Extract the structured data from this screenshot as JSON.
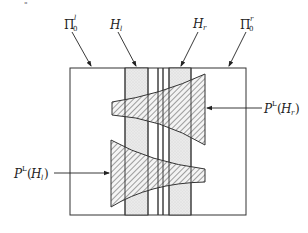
{
  "corner_mark": "\"",
  "labels": {
    "pi_left": {
      "base": "Π",
      "sub": "0",
      "sup": "l"
    },
    "h_left": {
      "base": "H",
      "sub": "l"
    },
    "h_right": {
      "base": "H",
      "sub": "r"
    },
    "pi_right": {
      "base": "Π",
      "sub": "0",
      "sup": "r"
    },
    "p_h_right": {
      "base": "P",
      "sup": "L",
      "arg_open": "(",
      "arg_base": "H",
      "arg_sub": "r",
      "arg_close": ")"
    },
    "p_h_left": {
      "base": "P",
      "sup": "L",
      "arg_open": "(",
      "arg_base": "H",
      "arg_sub": "l",
      "arg_close": ")"
    }
  },
  "colors": {
    "line": "#333333",
    "band_fill": "#e6e6e6",
    "hatch": "#444444",
    "background": "#ffffff"
  }
}
